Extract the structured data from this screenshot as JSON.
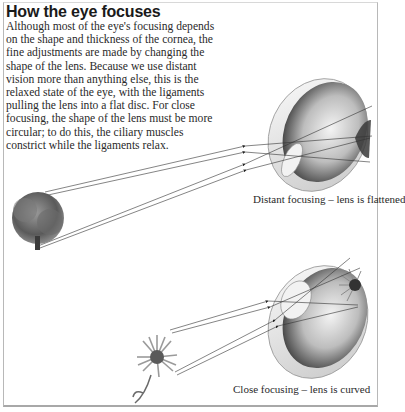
{
  "title": "How the eye focuses",
  "body": "Although most of the eye's focusing depends on the shape and thickness of the cornea, the fine adjustments are made by changing the shape of the lens. Because we use distant vision more than anything else, this is the relaxed state of the eye, with the ligaments pulling the lens into a flat disc. For close focusing, the shape of the lens must be more circular; to do this, the ciliary muscles constrict while the ligaments relax.",
  "figures": [
    {
      "id": "distant",
      "object": "tree",
      "caption": "Distant focusing – lens is flattened",
      "lens_shape": "flattened"
    },
    {
      "id": "close",
      "object": "flower",
      "caption": "Close focusing – lens is curved",
      "lens_shape": "curved"
    }
  ],
  "colors": {
    "text": "#2a2a2a",
    "line": "#333333",
    "eye_dark": "#4a4a4a",
    "eye_light": "#e8e8e8"
  }
}
